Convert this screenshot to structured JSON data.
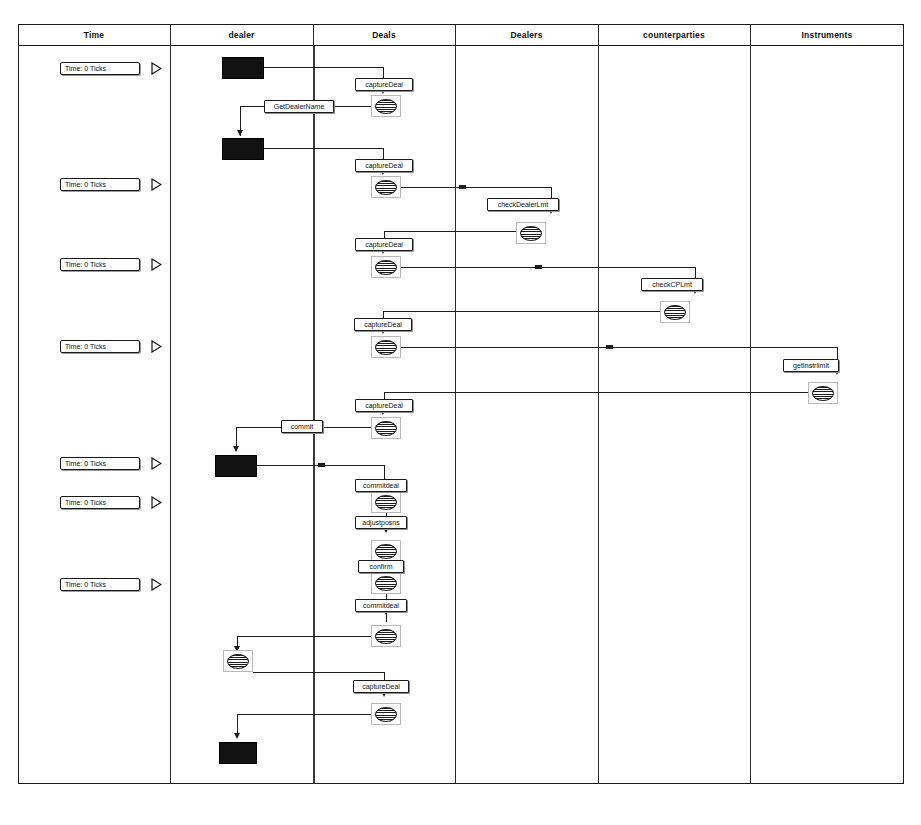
{
  "diagram": {
    "columns": [
      {
        "id": "time",
        "label": "Time",
        "x": 18,
        "width": 152
      },
      {
        "id": "dealer",
        "label": "dealer",
        "x": 170,
        "width": 143
      },
      {
        "id": "deals",
        "label": "Deals",
        "x": 313,
        "width": 142
      },
      {
        "id": "dealers",
        "label": "Dealers",
        "x": 455,
        "width": 143
      },
      {
        "id": "counterparties",
        "label": "counterparties",
        "x": 598,
        "width": 152
      },
      {
        "id": "instruments",
        "label": "Instruments",
        "x": 750,
        "width": 154
      }
    ],
    "time_markers": [
      {
        "label": "Time:   0 Ticks",
        "y": 62
      },
      {
        "label": "Time:   0 Ticks",
        "y": 178
      },
      {
        "label": "Time:   0 Ticks",
        "y": 258
      },
      {
        "label": "Time:   0 Ticks",
        "y": 340
      },
      {
        "label": "Time:   0 Ticks",
        "y": 457
      },
      {
        "label": "Time:   0 Ticks",
        "y": 496
      },
      {
        "label": "Time:   0 Ticks",
        "y": 578
      }
    ],
    "actor_blocks": [
      {
        "name": "dealer-actor-1",
        "x": 222,
        "y": 57,
        "w": 42,
        "h": 22
      },
      {
        "name": "dealer-actor-2",
        "x": 222,
        "y": 138,
        "w": 42,
        "h": 22
      },
      {
        "name": "dealer-actor-3",
        "x": 215,
        "y": 455,
        "w": 42,
        "h": 22
      },
      {
        "name": "dealer-actor-4",
        "x": 219,
        "y": 742,
        "w": 38,
        "h": 22
      }
    ],
    "messages": [
      {
        "name": "capture-deal-1",
        "label": "captureDeal",
        "x": 355,
        "y": 78,
        "w": 58
      },
      {
        "name": "get-dealer-name",
        "label": "GetDealerName",
        "x": 264,
        "y": 100,
        "w": 70
      },
      {
        "name": "capture-deal-2",
        "label": "captureDeal",
        "x": 355,
        "y": 159,
        "w": 58
      },
      {
        "name": "check-dealer-lmt",
        "label": "checkDealerLmt",
        "x": 487,
        "y": 198,
        "w": 72
      },
      {
        "name": "capture-deal-3",
        "label": "captureDeal",
        "x": 355,
        "y": 238,
        "w": 58
      },
      {
        "name": "check-cp-lmt",
        "label": "checkCPLmt",
        "x": 641,
        "y": 278,
        "w": 62
      },
      {
        "name": "capture-deal-4",
        "label": "captureDeal",
        "x": 354,
        "y": 318,
        "w": 58
      },
      {
        "name": "get-instr-limit",
        "label": "getInstrlimit",
        "x": 783,
        "y": 359,
        "w": 56
      },
      {
        "name": "capture-deal-5",
        "label": "captureDeal",
        "x": 355,
        "y": 399,
        "w": 58
      },
      {
        "name": "commit",
        "label": "commit",
        "x": 281,
        "y": 420,
        "w": 42
      },
      {
        "name": "commit-deal-1",
        "label": "commitdeal",
        "x": 355,
        "y": 479,
        "w": 52
      },
      {
        "name": "adjust-posns",
        "label": "adjustposns",
        "x": 355,
        "y": 516,
        "w": 52
      },
      {
        "name": "confirm",
        "label": "confirm",
        "x": 358,
        "y": 560,
        "w": 46
      },
      {
        "name": "commit-deal-2",
        "label": "commitdeal",
        "x": 355,
        "y": 599,
        "w": 52
      },
      {
        "name": "capture-deal-6",
        "label": "captureDeal",
        "x": 353,
        "y": 680,
        "w": 56
      }
    ],
    "object_icons": [
      {
        "name": "deals-object-1",
        "x": 371,
        "y": 95
      },
      {
        "name": "deals-object-2",
        "x": 371,
        "y": 176
      },
      {
        "name": "dealers-object-1",
        "x": 516,
        "y": 222
      },
      {
        "name": "deals-object-3",
        "x": 371,
        "y": 256
      },
      {
        "name": "counterparties-object-1",
        "x": 660,
        "y": 301
      },
      {
        "name": "deals-object-4",
        "x": 371,
        "y": 336
      },
      {
        "name": "instruments-object-1",
        "x": 808,
        "y": 382
      },
      {
        "name": "deals-object-5",
        "x": 371,
        "y": 417
      },
      {
        "name": "deals-object-6",
        "x": 371,
        "y": 491
      },
      {
        "name": "deals-object-7",
        "x": 371,
        "y": 540
      },
      {
        "name": "deals-object-8",
        "x": 371,
        "y": 572
      },
      {
        "name": "deals-object-9",
        "x": 371,
        "y": 625
      },
      {
        "name": "dealer-object-1",
        "x": 223,
        "y": 650
      },
      {
        "name": "deals-object-10",
        "x": 371,
        "y": 703
      }
    ],
    "colors": {
      "line": "#1e1e1e",
      "frame": "#1a1a1a",
      "actor_fill": "#121212",
      "background": "#ffffff"
    }
  }
}
